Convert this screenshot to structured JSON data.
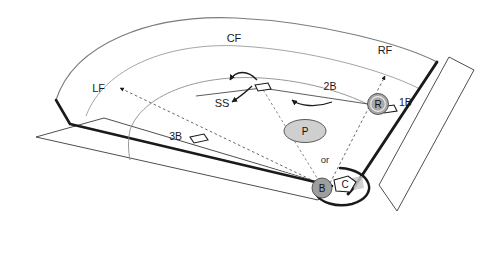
{
  "diagram": {
    "background_color": "#ffffff",
    "line_color": "#231f20",
    "thin_line_color": "#6d6e71",
    "marker_fill": "#a6a6a6",
    "mound_fill": "#cccccc",
    "shadow_color": "#c9c9c9"
  },
  "field_labels": {
    "left_field": "LF",
    "center_field": "CF",
    "right_field": "RF",
    "shortstop": "SS",
    "first_base": "1B",
    "second_base": "2B",
    "third_base": "3B",
    "alternative": "or"
  },
  "player_markers": [
    {
      "id": "runner",
      "label": "R",
      "shape": "circle"
    },
    {
      "id": "pitcher",
      "label": "P",
      "shape": "ellipse"
    },
    {
      "id": "batter",
      "label": "B",
      "shape": "circle"
    },
    {
      "id": "catcher",
      "label": "C",
      "shape": "pentagon"
    }
  ]
}
